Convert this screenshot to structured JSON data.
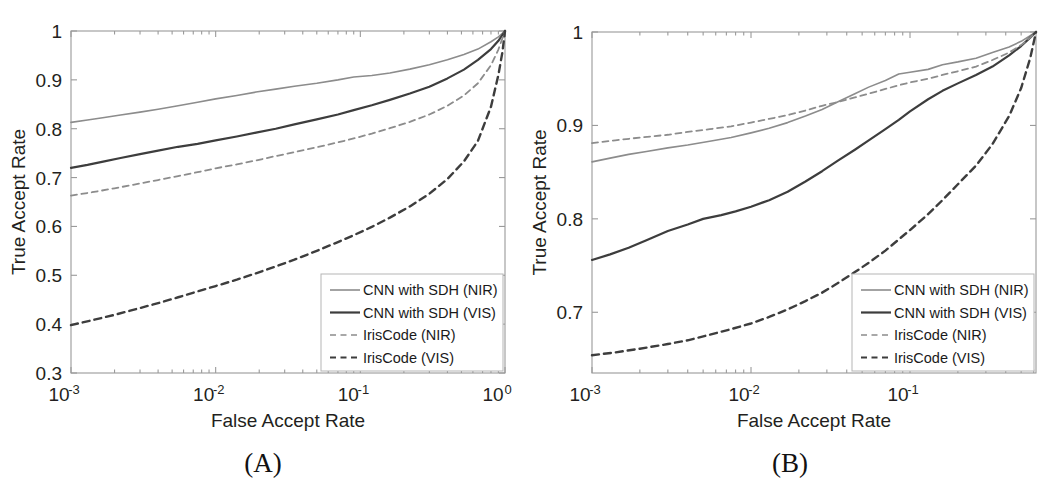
{
  "figure": {
    "caption_a": "(A)",
    "caption_b": "(B)"
  },
  "chart_data": [
    {
      "id": "panel-a",
      "type": "line",
      "title": "",
      "panel_label": "(A)",
      "xlabel": "False Accept Rate",
      "ylabel": "True Accept Rate",
      "xscale": "log",
      "xlim": [
        0.001,
        1.0
      ],
      "ylim": [
        0.3,
        1.0
      ],
      "xticks": [
        0.001,
        0.01,
        0.1,
        1
      ],
      "xtick_labels": [
        "10-3",
        "10-2",
        "10-1",
        "100"
      ],
      "xtick_bases": [
        "10",
        "10",
        "10",
        "10"
      ],
      "xtick_exponents": [
        "-3",
        "-2",
        "-1",
        "0"
      ],
      "yticks": [
        0.3,
        0.4,
        0.5,
        0.6,
        0.7,
        0.8,
        0.9,
        1
      ],
      "ytick_labels": [
        "0.3",
        "0.4",
        "0.5",
        "0.6",
        "0.7",
        "0.8",
        "0.9",
        "1"
      ],
      "grid": false,
      "legend_position": "lower right",
      "series": [
        {
          "name": "CNN with SDH (NIR)",
          "style": "solid",
          "color": "#8c8c8c",
          "width": 1.6,
          "points": [
            [
              0.001,
              0.813
            ],
            [
              0.0013,
              0.818
            ],
            [
              0.0017,
              0.823
            ],
            [
              0.0022,
              0.828
            ],
            [
              0.003,
              0.834
            ],
            [
              0.004,
              0.84
            ],
            [
              0.0055,
              0.847
            ],
            [
              0.0075,
              0.854
            ],
            [
              0.01,
              0.861
            ],
            [
              0.014,
              0.868
            ],
            [
              0.019,
              0.875
            ],
            [
              0.026,
              0.881
            ],
            [
              0.035,
              0.887
            ],
            [
              0.05,
              0.893
            ],
            [
              0.07,
              0.9
            ],
            [
              0.09,
              0.906
            ],
            [
              0.12,
              0.909
            ],
            [
              0.16,
              0.914
            ],
            [
              0.22,
              0.922
            ],
            [
              0.3,
              0.931
            ],
            [
              0.4,
              0.941
            ],
            [
              0.52,
              0.952
            ],
            [
              0.65,
              0.963
            ],
            [
              0.8,
              0.978
            ],
            [
              0.9,
              0.988
            ],
            [
              1.0,
              1.0
            ]
          ]
        },
        {
          "name": "CNN with SDH (VIS)",
          "style": "solid",
          "color": "#3d3d3d",
          "width": 2.2,
          "points": [
            [
              0.001,
              0.72
            ],
            [
              0.0013,
              0.726
            ],
            [
              0.0017,
              0.733
            ],
            [
              0.0022,
              0.74
            ],
            [
              0.003,
              0.748
            ],
            [
              0.004,
              0.755
            ],
            [
              0.0055,
              0.763
            ],
            [
              0.0075,
              0.769
            ],
            [
              0.01,
              0.776
            ],
            [
              0.014,
              0.784
            ],
            [
              0.019,
              0.792
            ],
            [
              0.026,
              0.8
            ],
            [
              0.035,
              0.809
            ],
            [
              0.05,
              0.819
            ],
            [
              0.07,
              0.829
            ],
            [
              0.09,
              0.838
            ],
            [
              0.12,
              0.848
            ],
            [
              0.16,
              0.859
            ],
            [
              0.22,
              0.872
            ],
            [
              0.3,
              0.886
            ],
            [
              0.4,
              0.903
            ],
            [
              0.52,
              0.921
            ],
            [
              0.65,
              0.941
            ],
            [
              0.8,
              0.963
            ],
            [
              0.9,
              0.98
            ],
            [
              1.0,
              1.0
            ]
          ]
        },
        {
          "name": "IrisCode (NIR)",
          "style": "dashed",
          "color": "#8c8c8c",
          "width": 1.8,
          "points": [
            [
              0.001,
              0.663
            ],
            [
              0.0014,
              0.67
            ],
            [
              0.002,
              0.678
            ],
            [
              0.003,
              0.688
            ],
            [
              0.004,
              0.695
            ],
            [
              0.0055,
              0.703
            ],
            [
              0.0075,
              0.711
            ],
            [
              0.01,
              0.719
            ],
            [
              0.014,
              0.727
            ],
            [
              0.019,
              0.735
            ],
            [
              0.026,
              0.744
            ],
            [
              0.035,
              0.752
            ],
            [
              0.05,
              0.762
            ],
            [
              0.07,
              0.772
            ],
            [
              0.09,
              0.78
            ],
            [
              0.12,
              0.79
            ],
            [
              0.16,
              0.801
            ],
            [
              0.22,
              0.814
            ],
            [
              0.3,
              0.829
            ],
            [
              0.4,
              0.847
            ],
            [
              0.52,
              0.868
            ],
            [
              0.65,
              0.893
            ],
            [
              0.8,
              0.93
            ],
            [
              0.9,
              0.962
            ],
            [
              1.0,
              1.0
            ]
          ]
        },
        {
          "name": "IrisCode (VIS)",
          "style": "dashed",
          "color": "#3d3d3d",
          "width": 2.4,
          "points": [
            [
              0.001,
              0.398
            ],
            [
              0.0014,
              0.408
            ],
            [
              0.002,
              0.419
            ],
            [
              0.003,
              0.433
            ],
            [
              0.004,
              0.443
            ],
            [
              0.0055,
              0.455
            ],
            [
              0.0075,
              0.467
            ],
            [
              0.01,
              0.478
            ],
            [
              0.014,
              0.491
            ],
            [
              0.019,
              0.504
            ],
            [
              0.026,
              0.518
            ],
            [
              0.035,
              0.532
            ],
            [
              0.05,
              0.55
            ],
            [
              0.07,
              0.568
            ],
            [
              0.09,
              0.582
            ],
            [
              0.12,
              0.599
            ],
            [
              0.16,
              0.618
            ],
            [
              0.22,
              0.641
            ],
            [
              0.3,
              0.667
            ],
            [
              0.4,
              0.697
            ],
            [
              0.52,
              0.733
            ],
            [
              0.65,
              0.775
            ],
            [
              0.8,
              0.845
            ],
            [
              0.9,
              0.91
            ],
            [
              0.96,
              0.957
            ],
            [
              1.0,
              1.0
            ]
          ]
        }
      ]
    },
    {
      "id": "panel-b",
      "type": "line",
      "title": "",
      "panel_label": "(B)",
      "xlabel": "False Accept Rate",
      "ylabel": "True Accept Rate",
      "xscale": "log",
      "xlim": [
        0.001,
        0.62
      ],
      "ylim": [
        0.635,
        1.0
      ],
      "xticks": [
        0.001,
        0.01,
        0.1
      ],
      "xtick_labels": [
        "10-3",
        "10-2",
        "10-1"
      ],
      "xtick_bases": [
        "10",
        "10",
        "10"
      ],
      "xtick_exponents": [
        "-3",
        "-2",
        "-1"
      ],
      "yticks": [
        0.7,
        0.8,
        0.9,
        1
      ],
      "ytick_labels": [
        "0.7",
        "0.8",
        "0.9",
        "1"
      ],
      "grid": false,
      "legend_position": "lower right",
      "series": [
        {
          "name": "CNN with SDH (NIR)",
          "style": "solid",
          "color": "#8c8c8c",
          "width": 1.6,
          "points": [
            [
              0.001,
              0.861
            ],
            [
              0.0013,
              0.865
            ],
            [
              0.0017,
              0.869
            ],
            [
              0.0022,
              0.872
            ],
            [
              0.003,
              0.876
            ],
            [
              0.004,
              0.879
            ],
            [
              0.0055,
              0.883
            ],
            [
              0.0075,
              0.887
            ],
            [
              0.01,
              0.892
            ],
            [
              0.013,
              0.897
            ],
            [
              0.017,
              0.903
            ],
            [
              0.022,
              0.91
            ],
            [
              0.028,
              0.917
            ],
            [
              0.035,
              0.925
            ],
            [
              0.045,
              0.934
            ],
            [
              0.055,
              0.941
            ],
            [
              0.07,
              0.948
            ],
            [
              0.085,
              0.955
            ],
            [
              0.1,
              0.957
            ],
            [
              0.13,
              0.96
            ],
            [
              0.16,
              0.965
            ],
            [
              0.2,
              0.968
            ],
            [
              0.26,
              0.972
            ],
            [
              0.33,
              0.978
            ],
            [
              0.42,
              0.984
            ],
            [
              0.5,
              0.99
            ],
            [
              0.57,
              0.996
            ],
            [
              0.62,
              1.0
            ]
          ]
        },
        {
          "name": "CNN with SDH (VIS)",
          "style": "solid",
          "color": "#3d3d3d",
          "width": 2.2,
          "points": [
            [
              0.001,
              0.756
            ],
            [
              0.0013,
              0.762
            ],
            [
              0.0017,
              0.769
            ],
            [
              0.0022,
              0.777
            ],
            [
              0.003,
              0.787
            ],
            [
              0.004,
              0.794
            ],
            [
              0.005,
              0.8
            ],
            [
              0.0065,
              0.804
            ],
            [
              0.008,
              0.808
            ],
            [
              0.01,
              0.813
            ],
            [
              0.013,
              0.82
            ],
            [
              0.017,
              0.829
            ],
            [
              0.022,
              0.84
            ],
            [
              0.028,
              0.851
            ],
            [
              0.035,
              0.862
            ],
            [
              0.045,
              0.874
            ],
            [
              0.055,
              0.884
            ],
            [
              0.07,
              0.896
            ],
            [
              0.085,
              0.906
            ],
            [
              0.1,
              0.915
            ],
            [
              0.13,
              0.928
            ],
            [
              0.16,
              0.937
            ],
            [
              0.2,
              0.945
            ],
            [
              0.26,
              0.954
            ],
            [
              0.33,
              0.963
            ],
            [
              0.42,
              0.975
            ],
            [
              0.5,
              0.985
            ],
            [
              0.57,
              0.994
            ],
            [
              0.62,
              1.0
            ]
          ]
        },
        {
          "name": "IrisCode (NIR)",
          "style": "dashed",
          "color": "#8c8c8c",
          "width": 1.8,
          "points": [
            [
              0.001,
              0.881
            ],
            [
              0.0014,
              0.884
            ],
            [
              0.002,
              0.887
            ],
            [
              0.003,
              0.89
            ],
            [
              0.004,
              0.893
            ],
            [
              0.0055,
              0.896
            ],
            [
              0.0075,
              0.899
            ],
            [
              0.01,
              0.903
            ],
            [
              0.013,
              0.907
            ],
            [
              0.017,
              0.911
            ],
            [
              0.022,
              0.916
            ],
            [
              0.028,
              0.921
            ],
            [
              0.035,
              0.925
            ],
            [
              0.045,
              0.93
            ],
            [
              0.055,
              0.934
            ],
            [
              0.07,
              0.939
            ],
            [
              0.085,
              0.943
            ],
            [
              0.1,
              0.946
            ],
            [
              0.13,
              0.95
            ],
            [
              0.16,
              0.954
            ],
            [
              0.2,
              0.958
            ],
            [
              0.26,
              0.963
            ],
            [
              0.33,
              0.97
            ],
            [
              0.42,
              0.978
            ],
            [
              0.5,
              0.986
            ],
            [
              0.57,
              0.994
            ],
            [
              0.62,
              1.0
            ]
          ]
        },
        {
          "name": "IrisCode (VIS)",
          "style": "dashed",
          "color": "#3d3d3d",
          "width": 2.4,
          "points": [
            [
              0.001,
              0.654
            ],
            [
              0.0014,
              0.657
            ],
            [
              0.002,
              0.661
            ],
            [
              0.003,
              0.666
            ],
            [
              0.004,
              0.67
            ],
            [
              0.0055,
              0.676
            ],
            [
              0.0075,
              0.682
            ],
            [
              0.01,
              0.688
            ],
            [
              0.013,
              0.695
            ],
            [
              0.017,
              0.703
            ],
            [
              0.022,
              0.712
            ],
            [
              0.028,
              0.721
            ],
            [
              0.035,
              0.731
            ],
            [
              0.045,
              0.743
            ],
            [
              0.055,
              0.753
            ],
            [
              0.07,
              0.766
            ],
            [
              0.085,
              0.778
            ],
            [
              0.1,
              0.788
            ],
            [
              0.13,
              0.805
            ],
            [
              0.16,
              0.82
            ],
            [
              0.2,
              0.837
            ],
            [
              0.26,
              0.857
            ],
            [
              0.33,
              0.88
            ],
            [
              0.42,
              0.91
            ],
            [
              0.5,
              0.94
            ],
            [
              0.57,
              0.972
            ],
            [
              0.62,
              1.0
            ]
          ]
        }
      ]
    }
  ],
  "legend": {
    "items": [
      {
        "label": "CNN with SDH (NIR)",
        "style": "solid",
        "color": "#8c8c8c"
      },
      {
        "label": "CNN with SDH (VIS)",
        "style": "solid",
        "color": "#3d3d3d"
      },
      {
        "label": "IrisCode (NIR)",
        "style": "dashed",
        "color": "#8c8c8c"
      },
      {
        "label": "IrisCode (VIS)",
        "style": "dashed",
        "color": "#3d3d3d"
      }
    ]
  },
  "colors": {
    "nir": "#8c8c8c",
    "vis": "#3d3d3d",
    "axis": "#9a9a9a",
    "text": "#231f20",
    "background": "#ffffff"
  }
}
